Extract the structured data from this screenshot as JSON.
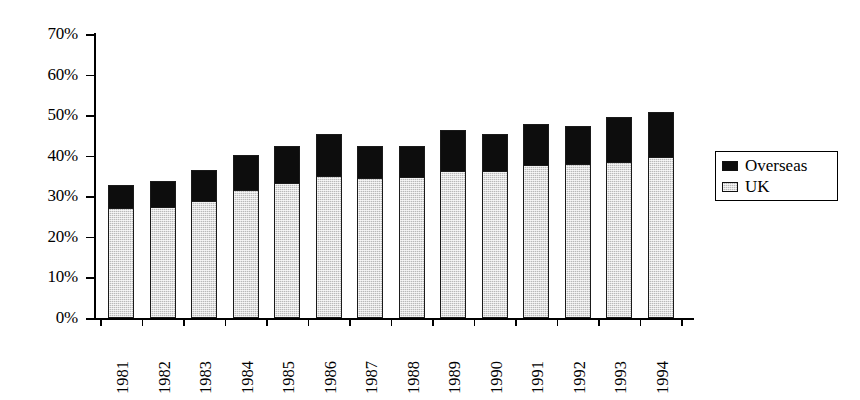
{
  "chart_data": {
    "type": "bar",
    "subtype": "stacked-column",
    "title": "",
    "xlabel": "",
    "ylabel": "",
    "ylim": [
      0,
      70
    ],
    "ytick_step": 10,
    "ytick_labels": [
      "0%",
      "10%",
      "20%",
      "30%",
      "40%",
      "50%",
      "60%",
      "70%"
    ],
    "ytick_values": [
      0,
      10,
      20,
      30,
      40,
      50,
      60,
      70
    ],
    "grid": false,
    "legend_position": "right",
    "categories": [
      "1981",
      "1982",
      "1983",
      "1984",
      "1985",
      "1986",
      "1987",
      "1988",
      "1989",
      "1990",
      "1991",
      "1992",
      "1993",
      "1994"
    ],
    "series": [
      {
        "name": "UK",
        "color": "#b9b9b9",
        "pattern": "fine-dotted-grey",
        "values": [
          27.4,
          27.4,
          29.0,
          31.8,
          33.5,
          35.2,
          34.6,
          34.8,
          36.3,
          36.5,
          37.9,
          38.0,
          38.6,
          39.8
        ]
      },
      {
        "name": "Overseas",
        "color": "#0d0d0d",
        "pattern": "solid-black",
        "values": [
          5.3,
          6.3,
          7.6,
          8.5,
          9.0,
          10.1,
          7.9,
          7.6,
          10.1,
          8.8,
          9.8,
          9.4,
          10.9,
          10.9
        ]
      }
    ],
    "totals": [
      32.7,
      33.7,
      36.6,
      40.3,
      42.5,
      45.3,
      42.5,
      42.4,
      46.4,
      45.3,
      47.7,
      47.4,
      49.5,
      50.7
    ]
  },
  "legend": {
    "items": [
      {
        "label": "Overseas",
        "swatch": "overseas-swatch"
      },
      {
        "label": "UK",
        "swatch": "uk-swatch"
      }
    ]
  }
}
